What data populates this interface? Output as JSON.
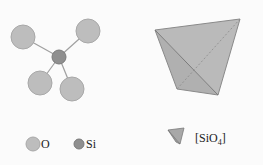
{
  "diagram": {
    "colors": {
      "oxygen": "#bdbdbd",
      "oxygen_stroke": "#a8a8a8",
      "silicon": "#8f8f8f",
      "silicon_stroke": "#7a7a7a",
      "bond": "#a0a0a0",
      "tetra_fill": "#b4b4b4",
      "tetra_edge": "#8a8a8a"
    },
    "molecule": {
      "silicon": {
        "cx": 59,
        "cy": 57,
        "r": 7
      },
      "oxygens": [
        {
          "cx": 23,
          "cy": 37,
          "r": 12
        },
        {
          "cx": 88,
          "cy": 31,
          "r": 12
        },
        {
          "cx": 40,
          "cy": 83,
          "r": 12
        },
        {
          "cx": 72,
          "cy": 89,
          "r": 12
        }
      ]
    },
    "tetrahedron": {
      "vertices": {
        "top_left": [
          155,
          30
        ],
        "top_right": [
          240,
          19
        ],
        "bottom_left": [
          177,
          89
        ],
        "bottom_right": [
          218,
          95
        ]
      }
    },
    "legend": {
      "oxygen_label": "O",
      "silicon_label": "Si",
      "tetra_label": "[SiO",
      "tetra_subscript": "4",
      "tetra_label_close": "]"
    }
  }
}
